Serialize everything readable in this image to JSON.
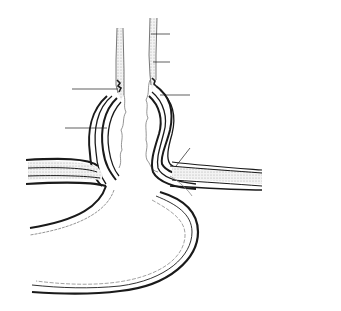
{
  "diagram": {
    "title_line1": "TYPE I",
    "title_line2": "HIATAL HERNIA",
    "labels": {
      "esophageal_mucosa": "ESOPHAGEAL MUCOSA",
      "esophageal_muscle": "ESOPHAGEAL MUSCLE",
      "squamo_columnar_1": "SQUAMO",
      "squamo_columnar_2": "COLUMNAR",
      "squamo_columnar_3": "JUNCTION",
      "phreno_esophageal_1": "PHRENO-ESOPHAGEAL",
      "phreno_esophageal_2": "MEMBRANE",
      "stomach": "STOMACH",
      "endothoracic_fascia": "ENDOTHORACIC FASCIA",
      "diaphragm": "DIAPHRAGM",
      "endoabdominal_fascia": "ENDOABDOMINAL FASCIA",
      "peritoneum": "PERITONEUM"
    },
    "colors": {
      "ink": "#1a1a1a",
      "stipple": "#d9d9d9",
      "thin_line": "#6e6e6e"
    }
  }
}
